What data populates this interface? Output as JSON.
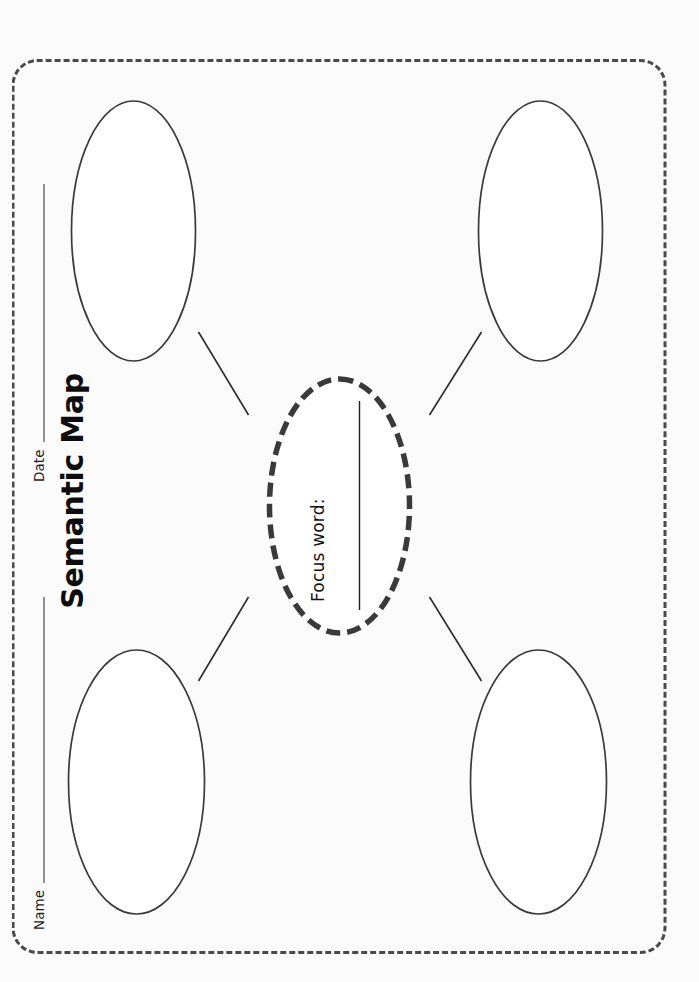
{
  "page": {
    "background_color": "#fbfbfb",
    "frame_color": "#4a4a4a",
    "ink_color": "#2a2a2a",
    "orientation_note": "landscape-content-rotated-90-ccw"
  },
  "header": {
    "name_label": "Name",
    "date_label": "Date"
  },
  "title": "Semantic Map",
  "center_node": {
    "prompt": "Focus word:",
    "answer_value": "",
    "border_style": "dashed-thick",
    "border_color": "#3a3a3a"
  },
  "branch_nodes": [
    {
      "id": "branch-top-left",
      "value": ""
    },
    {
      "id": "branch-top-right",
      "value": ""
    },
    {
      "id": "branch-bottom-left",
      "value": ""
    },
    {
      "id": "branch-bottom-right",
      "value": ""
    }
  ]
}
